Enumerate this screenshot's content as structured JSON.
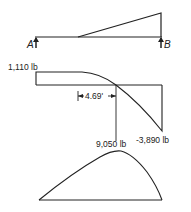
{
  "beam": {
    "support_left_label": "A",
    "support_right_label": "B",
    "load_type": "triangular distributed load"
  },
  "shear_diagram": {
    "max_label": "1,110 lb",
    "min_label": "-3,890 lb",
    "zero_distance_label": "4.69'"
  },
  "moment_diagram": {
    "max_label": "9,050 lb"
  }
}
